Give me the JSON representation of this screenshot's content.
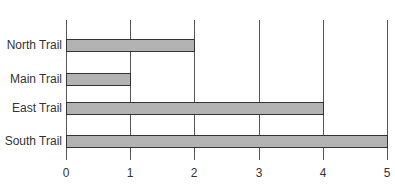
{
  "chart_data": {
    "type": "bar",
    "orientation": "horizontal",
    "title": "",
    "xlabel": "",
    "ylabel": "",
    "categories": [
      "North Trail",
      "Main Trail",
      "East Trail",
      "South Trail"
    ],
    "values": [
      2,
      1,
      4,
      5
    ],
    "xlim": [
      0,
      5
    ],
    "x_ticks": [
      "0",
      "1",
      "2",
      "3",
      "4",
      "5"
    ],
    "grid": true,
    "legend": null,
    "bar_color": "#b3b3b3",
    "bar_edge_color": "#333333"
  }
}
